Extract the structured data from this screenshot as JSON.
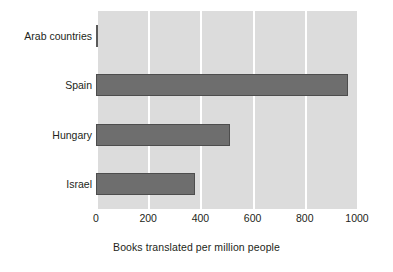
{
  "chart_data": {
    "type": "bar",
    "orientation": "horizontal",
    "title": "",
    "xlabel": "Books translated per million people",
    "ylabel": "",
    "categories": [
      "Arab countries",
      "Spain",
      "Hungary",
      "Israel"
    ],
    "values": [
      5,
      965,
      515,
      380
    ],
    "xlim": [
      0,
      1000
    ],
    "xticks": [
      0,
      200,
      400,
      600,
      800,
      1000
    ],
    "xtick_labels": [
      "0",
      "200",
      "400",
      "600",
      "800",
      "1000"
    ],
    "grid": true,
    "grid_axis": "x",
    "grid_color": "#ffffff",
    "legend": false,
    "legend_position": "none",
    "plot_background": "#dcdcdc",
    "figure_background": "#ffffff",
    "bar_color": "#6e6e6e",
    "bar_edge_color": "#4d4d4d",
    "text_color": "#231f20",
    "series": [
      {
        "name": "Books translated per million people",
        "values": [
          5,
          965,
          515,
          380
        ]
      }
    ]
  },
  "axis_title": {
    "x": "Books translated per million people"
  }
}
